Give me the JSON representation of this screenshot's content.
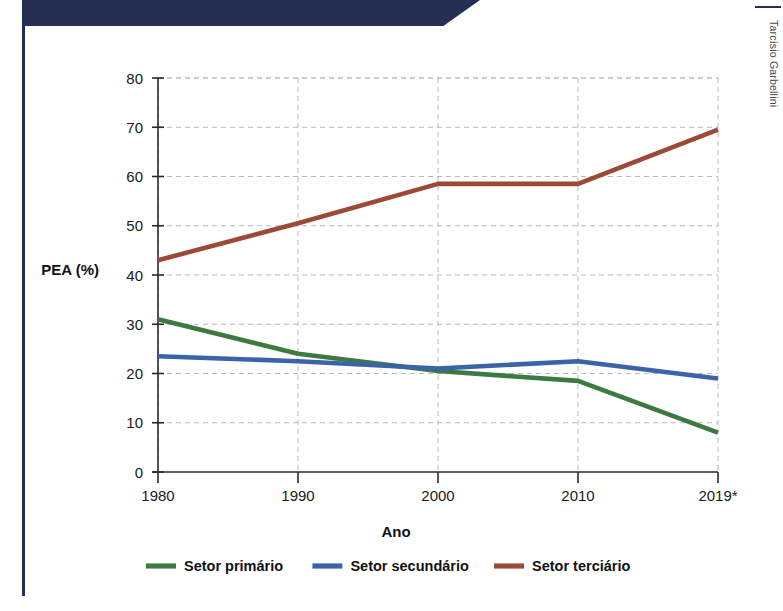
{
  "credit": {
    "text": "Tarcísio Garbellini"
  },
  "chart_data": {
    "type": "line",
    "title": "",
    "subtitle": "",
    "xlabel": "Ano",
    "ylabel": "PEA (%)",
    "x": [
      "1980",
      "1990",
      "2000",
      "2010",
      "2019*"
    ],
    "categories": [
      "1980",
      "1990",
      "2000",
      "2010",
      "2019*"
    ],
    "xtick_labels": [
      "1980",
      "1990",
      "2000",
      "2010",
      "2019*"
    ],
    "ytick_labels": [
      "0",
      "10",
      "20",
      "30",
      "40",
      "50",
      "60",
      "70",
      "80"
    ],
    "yticks": [
      0,
      10,
      20,
      30,
      40,
      50,
      60,
      70,
      80
    ],
    "ylim": [
      0,
      80
    ],
    "xlim": [
      1980,
      2019
    ],
    "grid": true,
    "legend_position": "bottom",
    "series": [
      {
        "name": "Setor primário",
        "color": "#3d7a42",
        "values": [
          31,
          24,
          20.5,
          18.5,
          8
        ]
      },
      {
        "name": "Setor secundário",
        "color": "#3a63a8",
        "values": [
          23.5,
          22.5,
          21,
          22.5,
          19
        ]
      },
      {
        "name": "Setor terciário",
        "color": "#9c4a36",
        "values": [
          43,
          50.5,
          58.5,
          58.5,
          69.5
        ]
      }
    ],
    "legend": [
      {
        "label": "Setor primário",
        "color": "#3d7a42"
      },
      {
        "label": "Setor secundário",
        "color": "#3a63a8"
      },
      {
        "label": "Setor terciário",
        "color": "#9c4a36"
      }
    ],
    "colors": {
      "primary_sector": "#3d7a42",
      "secondary_sector": "#3a63a8",
      "tertiary_sector": "#9c4a36",
      "banner": "#252f54",
      "gridline": "#b9b9c0",
      "axis": "#2a2a2a"
    }
  }
}
